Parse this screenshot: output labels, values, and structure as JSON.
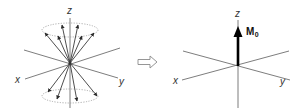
{
  "figure": {
    "left_panel": {
      "axis_labels": {
        "z": "z",
        "x": "x",
        "y": "y"
      },
      "description": "precessing nuclear spins on two cones (parallel and antiparallel)"
    },
    "transition_arrow": {
      "icon": "hollow-right-arrow-icon"
    },
    "right_panel": {
      "axis_labels": {
        "z": "z",
        "x": "x",
        "y": "y"
      },
      "vector_label": "M",
      "vector_subscript": "0"
    }
  },
  "colors": {
    "axis": "#6e6e6e",
    "spin_vector": "#3a3a3a",
    "net_vector": "#000000",
    "ellipse": "#9a9a9a"
  }
}
